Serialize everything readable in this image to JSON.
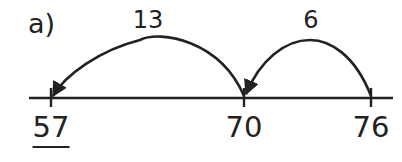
{
  "part_label": "a)",
  "number_line": {
    "ticks": [
      {
        "value": "57",
        "x": 51,
        "underlined": true
      },
      {
        "value": "70",
        "x": 244,
        "underlined": false
      },
      {
        "value": "76",
        "x": 371,
        "underlined": false
      }
    ]
  },
  "jumps": [
    {
      "label": "13",
      "from": "70",
      "to": "57",
      "label_x": 148
    },
    {
      "label": "6",
      "from": "76",
      "to": "70",
      "label_x": 311
    }
  ],
  "colors": {
    "ink": "#222222",
    "background": "#ffffff"
  }
}
